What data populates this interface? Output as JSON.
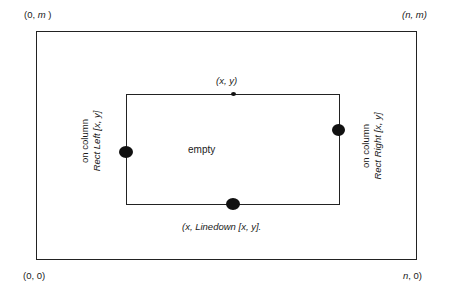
{
  "diagram": {
    "corners": {
      "top_left": "(0, m )",
      "top_right": "(n, m)",
      "bottom_left": "(0, 0)",
      "bottom_right": "(n, 0)"
    },
    "inner": {
      "top_label": "(x, y)",
      "center_label": "empty",
      "bottom_label": "(x,  Linedown [x, y].",
      "left_label_line1": "on column",
      "left_label_line2": "Rect Left [x, y]",
      "right_label_line1": "on column",
      "right_label_line2": "Rect Right [x, y]"
    }
  }
}
